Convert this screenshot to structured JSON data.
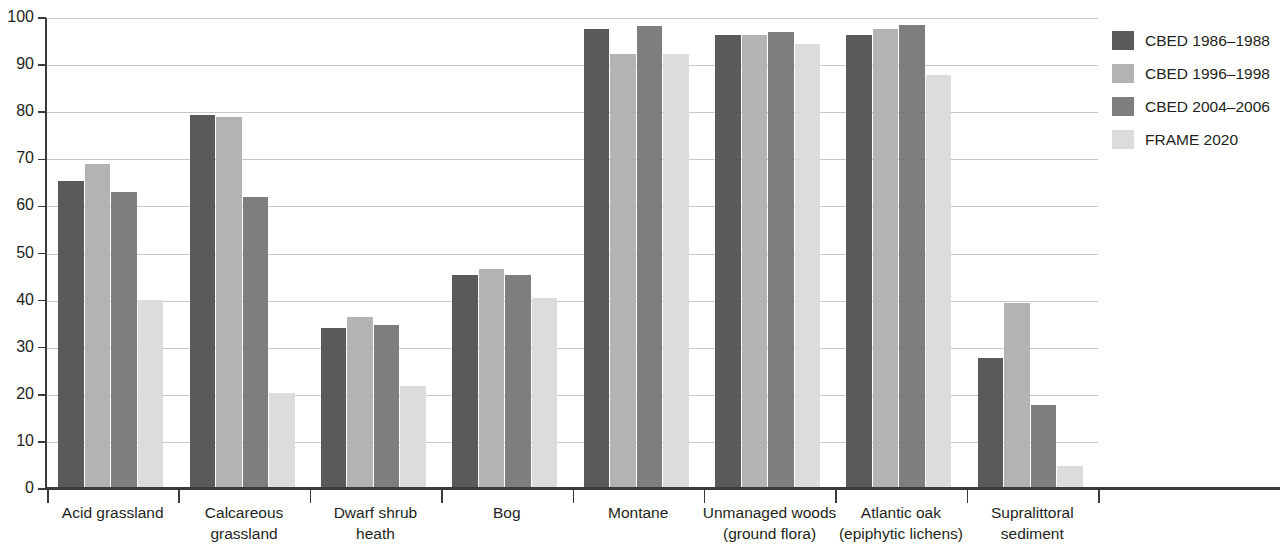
{
  "chart_data": {
    "type": "bar",
    "title": "",
    "subtitle": "",
    "xlabel": "",
    "ylabel": "",
    "ylim": [
      0,
      100
    ],
    "y_ticks": [
      0,
      10,
      20,
      30,
      40,
      50,
      60,
      70,
      80,
      90,
      100
    ],
    "grid": true,
    "legend_position": "right",
    "categories": [
      "Acid grassland",
      "Calcareous\ngrassland",
      "Dwarf shrub\nheath",
      "Bog",
      "Montane",
      "Unmanaged woods\n(ground flora)",
      "Atlantic oak\n(epiphytic lichens)",
      "Supralittoral\nsediment"
    ],
    "series": [
      {
        "name": "CBED 1986–1988",
        "color": "#5a5a5a",
        "values": [
          65.5,
          79.4,
          34.2,
          45.4,
          97.6,
          96.4,
          96.5,
          27.9
        ]
      },
      {
        "name": "CBED 1996–1998",
        "color": "#b3b3b3",
        "values": [
          69.0,
          79.0,
          36.6,
          46.7,
          92.4,
          96.5,
          97.7,
          39.5
        ]
      },
      {
        "name": "CBED 2004–2006",
        "color": "#7e7e7e",
        "values": [
          63.0,
          62.0,
          34.8,
          45.5,
          98.4,
          97.1,
          98.5,
          17.8
        ]
      },
      {
        "name": "FRAME 2020",
        "color": "#dcdcdc",
        "values": [
          40.2,
          20.3,
          21.8,
          40.6,
          92.4,
          94.5,
          88.0,
          4.8
        ]
      }
    ]
  },
  "axis": {
    "y_tick_labels": [
      "0",
      "10",
      "20",
      "30",
      "40",
      "50",
      "60",
      "70",
      "80",
      "90",
      "100"
    ]
  }
}
